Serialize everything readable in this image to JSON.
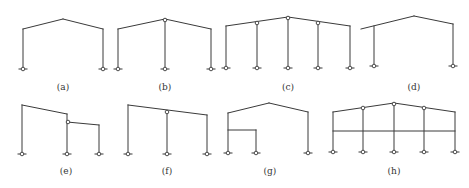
{
  "figure": {
    "line_color": "#3a3a3a",
    "background": "#ffffff",
    "frames": [
      {
        "id": "a",
        "label": "(a)",
        "label_pos": [
          63,
          82
        ],
        "members": [
          [
            23,
            69,
            23,
            29
          ],
          [
            23,
            29,
            63,
            19
          ],
          [
            63,
            19,
            103,
            29
          ],
          [
            103,
            29,
            103,
            69
          ]
        ],
        "supports": [
          [
            23,
            69
          ],
          [
            103,
            69
          ]
        ],
        "hinges": []
      },
      {
        "id": "b",
        "label": "(b)",
        "label_pos": [
          165,
          82
        ],
        "members": [
          [
            118,
            69,
            118,
            29
          ],
          [
            118,
            29,
            165,
            19
          ],
          [
            165,
            19,
            211,
            29
          ],
          [
            211,
            29,
            211,
            69
          ],
          [
            165,
            19,
            165,
            69
          ]
        ],
        "supports": [
          [
            118,
            69
          ],
          [
            165,
            69
          ],
          [
            211,
            69
          ]
        ],
        "hinges": [
          [
            165,
            20
          ]
        ]
      },
      {
        "id": "c",
        "label": "(c)",
        "label_pos": [
          288,
          82
        ],
        "members": [
          [
            226,
            68,
            226,
            26
          ],
          [
            226,
            26,
            288,
            17
          ],
          [
            288,
            17,
            350,
            26
          ],
          [
            350,
            26,
            350,
            68
          ],
          [
            257,
            22,
            257,
            68
          ],
          [
            288,
            17,
            288,
            68
          ],
          [
            318,
            22,
            318,
            68
          ]
        ],
        "supports": [
          [
            226,
            68
          ],
          [
            257,
            68
          ],
          [
            288,
            68
          ],
          [
            318,
            68
          ],
          [
            350,
            68
          ]
        ],
        "hinges": [
          [
            257,
            23
          ],
          [
            288,
            18
          ],
          [
            318,
            23
          ]
        ]
      },
      {
        "id": "d",
        "label": "(d)",
        "label_pos": [
          414,
          82
        ],
        "members": [
          [
            361,
            29,
            414,
            16
          ],
          [
            414,
            16,
            453,
            24
          ],
          [
            374,
            26,
            374,
            66
          ],
          [
            453,
            24,
            453,
            66
          ]
        ],
        "supports": [
          [
            374,
            66
          ],
          [
            453,
            66
          ]
        ],
        "hinges": []
      },
      {
        "id": "e",
        "label": "(e)",
        "label_pos": [
          66,
          166
        ],
        "members": [
          [
            22,
            154,
            22,
            105
          ],
          [
            22,
            105,
            67,
            114
          ],
          [
            67,
            114,
            67,
            154
          ],
          [
            67,
            122,
            99,
            125
          ],
          [
            99,
            125,
            99,
            154
          ]
        ],
        "supports": [
          [
            22,
            154
          ],
          [
            67,
            154
          ],
          [
            99,
            154
          ]
        ],
        "hinges": [
          [
            68,
            122
          ]
        ]
      },
      {
        "id": "f",
        "label": "(f)",
        "label_pos": [
          167,
          166
        ],
        "members": [
          [
            128,
            154,
            128,
            105
          ],
          [
            128,
            105,
            207,
            115
          ],
          [
            207,
            115,
            207,
            154
          ],
          [
            167,
            111,
            167,
            154
          ]
        ],
        "supports": [
          [
            128,
            154
          ],
          [
            167,
            154
          ],
          [
            207,
            154
          ]
        ],
        "hinges": [
          [
            167,
            112
          ]
        ]
      },
      {
        "id": "g",
        "label": "(g)",
        "label_pos": [
          270,
          166
        ],
        "members": [
          [
            228,
            153,
            228,
            113
          ],
          [
            228,
            113,
            269,
            103
          ],
          [
            269,
            103,
            308,
            112
          ],
          [
            308,
            112,
            308,
            153
          ],
          [
            228,
            130,
            256,
            130
          ],
          [
            256,
            130,
            256,
            153
          ]
        ],
        "supports": [
          [
            228,
            153
          ],
          [
            256,
            153
          ],
          [
            308,
            153
          ]
        ],
        "hinges": []
      },
      {
        "id": "h",
        "label": "(h)",
        "label_pos": [
          394,
          166
        ],
        "members": [
          [
            333,
            152,
            333,
            112
          ],
          [
            333,
            112,
            394,
            103
          ],
          [
            394,
            103,
            455,
            112
          ],
          [
            455,
            112,
            455,
            152
          ],
          [
            363,
            108,
            363,
            152
          ],
          [
            394,
            103,
            394,
            152
          ],
          [
            424,
            108,
            424,
            152
          ],
          [
            333,
            131,
            455,
            131
          ]
        ],
        "supports": [
          [
            333,
            152
          ],
          [
            363,
            152
          ],
          [
            394,
            152
          ],
          [
            424,
            152
          ],
          [
            455,
            152
          ]
        ],
        "hinges": [
          [
            363,
            108
          ],
          [
            394,
            104
          ],
          [
            424,
            108
          ]
        ]
      }
    ]
  }
}
